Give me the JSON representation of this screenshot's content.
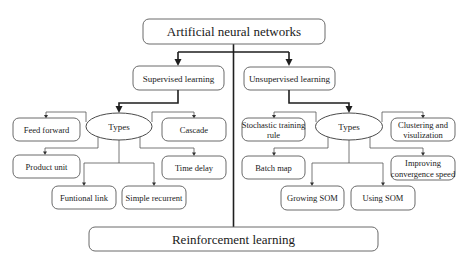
{
  "diagram": {
    "root": "Artificial neural networks",
    "bottom": "Reinforcement learning",
    "supervised": {
      "title": "Supervised learning",
      "hub": "Types",
      "types": [
        "Feed forward",
        "Cascade",
        "Product unit",
        "Time delay",
        "Funtional link",
        "Simple recurrent"
      ]
    },
    "unsupervised": {
      "title": "Unsupervised learning",
      "hub": "Types",
      "types": [
        [
          "Stochastic training",
          "rule"
        ],
        [
          "Clustering and",
          "visulization"
        ],
        [
          "Batch map"
        ],
        [
          "Improving",
          "convergence speed"
        ],
        [
          "Growing SOM"
        ],
        [
          "Using SOM"
        ]
      ]
    }
  },
  "colors": {
    "line": "#1e1e1e",
    "box_border": "#6a6a6a",
    "text": "#1a1a1a",
    "background": "#ffffff"
  }
}
